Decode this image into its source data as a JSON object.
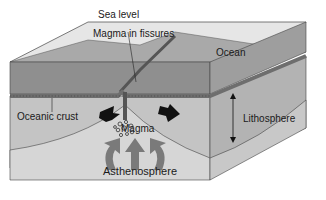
{
  "diagram": {
    "labels": {
      "sea_level": "Sea level",
      "magma_in_fissures": "Magma in fissures",
      "ocean": "Ocean",
      "oceanic_crust": "Oceanic crust",
      "lithosphere": "Lithosphere",
      "magma": "Magma",
      "asthenosphere": "Asthenosphere"
    },
    "colors": {
      "ocean_top": "#d9d9d9",
      "ocean_side": "#8c8c8c",
      "lithosphere": "#bdbdbd",
      "asthenosphere": "#d4d4d4",
      "crust_band": "#6e6e6e",
      "arrow_dark": "#111111",
      "arrow_gray": "#7a7a7a"
    }
  }
}
